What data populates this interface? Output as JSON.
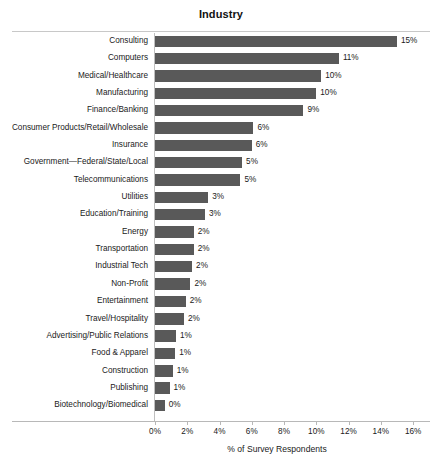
{
  "chart_data": {
    "type": "bar",
    "orientation": "horizontal",
    "title": "Industry",
    "xlabel": "% of Survey Respondents",
    "ylabel": "",
    "xlim": [
      0,
      16
    ],
    "xtick_labels": [
      "0%",
      "2%",
      "4%",
      "6%",
      "8%",
      "10%",
      "12%",
      "14%",
      "16%"
    ],
    "xtick_values": [
      0,
      2,
      4,
      6,
      8,
      10,
      12,
      14,
      16
    ],
    "grid": false,
    "legend": "none",
    "bar_color": "#595959",
    "categories": [
      "Consulting",
      "Computers",
      "Medical/Healthcare",
      "Manufacturing",
      "Finance/Banking",
      "Consumer Products/Retail/Wholesale",
      "Insurance",
      "Government—Federal/State/Local",
      "Telecommunications",
      "Utilities",
      "Education/Training",
      "Energy",
      "Transportation",
      "Industrial Tech",
      "Non-Profit",
      "Entertainment",
      "Travel/Hospitality",
      "Advertising/Public Relations",
      "Food & Apparel",
      "Construction",
      "Publishing",
      "Biotechnology/Biomedical"
    ],
    "values": [
      15.0,
      11.4,
      10.3,
      10.0,
      9.2,
      6.1,
      6.0,
      5.4,
      5.3,
      3.3,
      3.1,
      2.4,
      2.4,
      2.3,
      2.2,
      1.9,
      1.8,
      1.3,
      1.25,
      1.1,
      0.9,
      0.6
    ],
    "data_labels": [
      "15%",
      "11%",
      "10%",
      "10%",
      "9%",
      "6%",
      "6%",
      "5%",
      "5%",
      "3%",
      "3%",
      "2%",
      "2%",
      "2%",
      "2%",
      "2%",
      "2%",
      "1%",
      "1%",
      "1%",
      "1%",
      "0%"
    ]
  }
}
